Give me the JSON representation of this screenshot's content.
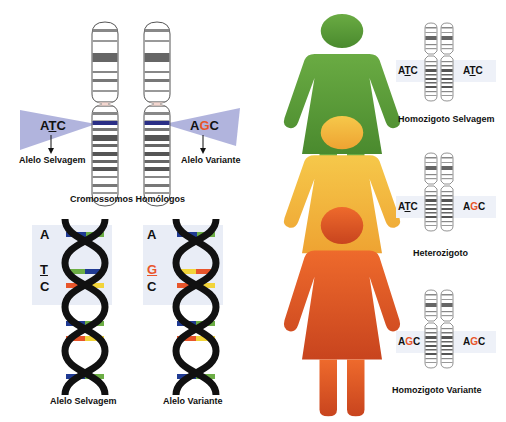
{
  "homologous": {
    "title": "Cromossomos Homólogos",
    "left": {
      "seq_before": "A",
      "seq_mid": "T",
      "seq_after": "C",
      "label": "Alelo Selvagem"
    },
    "right": {
      "seq_before": "A",
      "seq_mid": "G",
      "seq_after": "C",
      "label": "Alelo Variante"
    },
    "callout_color": "#a9acd9",
    "marker_color": "#2b2f86"
  },
  "dna": {
    "left": {
      "bases": [
        "A",
        "T",
        "C"
      ],
      "label": "Alelo Selvagem"
    },
    "right": {
      "bases": [
        "A",
        "G",
        "C"
      ],
      "label": "Alelo Variante"
    },
    "colors": {
      "blue": "#1f3a93",
      "green": "#6cae45",
      "orange": "#e8552a",
      "yellow": "#f2d43a",
      "backbone": "#111111"
    }
  },
  "genotypes": [
    {
      "figure_color": "#5e9f3a",
      "left_seq": {
        "a": "A",
        "m": "T",
        "c": "C"
      },
      "right_seq": {
        "a": "A",
        "m": "T",
        "c": "C"
      },
      "label": "Homozigoto Selvagem"
    },
    {
      "figure_color": "#f2b43a",
      "left_seq": {
        "a": "A",
        "m": "T",
        "c": "C"
      },
      "right_seq": {
        "a": "A",
        "m": "G",
        "c": "C"
      },
      "label": "Heterozigoto"
    },
    {
      "figure_color": "#e0602a",
      "left_seq": {
        "a": "A",
        "m": "G",
        "c": "C"
      },
      "right_seq": {
        "a": "A",
        "m": "G",
        "c": "C"
      },
      "label": "Homozigoto Variante"
    }
  ]
}
